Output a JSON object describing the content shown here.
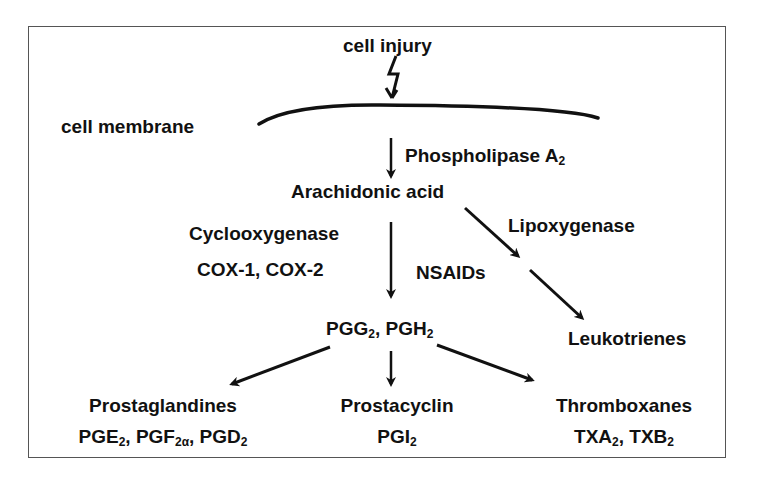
{
  "diagram": {
    "title_node": "cell injury",
    "membrane_label": "cell membrane",
    "enzyme_pla2": {
      "text": "Phospholipase A",
      "sub": "2"
    },
    "arachidonic_acid": "Arachidonic acid",
    "cyclooxygenase": "Cyclooxygenase",
    "cox_isoforms": "COX-1, COX-2",
    "lipoxygenase": "Lipoxygenase",
    "nsaids": "NSAIDs",
    "leukotrienes": "Leukotrienes",
    "intermediates": {
      "pgg": "PGG",
      "pgg_sub": "2",
      "sep": ", ",
      "pgh": "PGH",
      "pgh_sub": "2"
    },
    "products": [
      {
        "name": "Prostaglandines",
        "members": [
          {
            "base": "PGE",
            "sub": "2"
          },
          {
            "base": "PGF",
            "sub": "2α"
          },
          {
            "base": "PGD",
            "sub": "2"
          }
        ]
      },
      {
        "name": "Prostacyclin",
        "members": [
          {
            "base": "PGI",
            "sub": "2"
          }
        ]
      },
      {
        "name": "Thromboxanes",
        "members": [
          {
            "base": "TXA",
            "sub": "2"
          },
          {
            "base": "TXB",
            "sub": "2"
          }
        ]
      }
    ],
    "colors": {
      "ink": "#111111",
      "border": "#555555",
      "background": "#ffffff"
    }
  }
}
